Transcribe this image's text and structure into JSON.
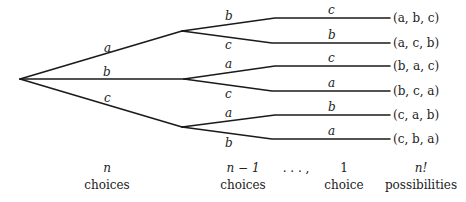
{
  "diagram": {
    "type": "permutation-tree",
    "root": {
      "x": 20,
      "y": 79
    },
    "level1": [
      {
        "label": "a",
        "node": {
          "x": 182,
          "y": 31
        },
        "label_pos": {
          "x": 107,
          "y": 49
        },
        "children": [
          {
            "label": "b",
            "label_pos": {
              "x": 229,
              "y": 18
            },
            "line_y": 18,
            "second": "c",
            "second_pos": {
              "x": 331,
              "y": 12
            },
            "leaf": "(a, b, c)"
          },
          {
            "label": "c",
            "label_pos": {
              "x": 229,
              "y": 48
            },
            "line_y": 43,
            "second": "b",
            "second_pos": {
              "x": 331,
              "y": 37
            },
            "leaf": "(a, c, b)"
          }
        ]
      },
      {
        "label": "b",
        "node": {
          "x": 184,
          "y": 79
        },
        "label_pos": {
          "x": 107,
          "y": 75
        },
        "children": [
          {
            "label": "a",
            "label_pos": {
              "x": 229,
              "y": 66
            },
            "line_y": 66,
            "second": "c",
            "second_pos": {
              "x": 331,
              "y": 60
            },
            "leaf": "(b, a, c)"
          },
          {
            "label": "c",
            "label_pos": {
              "x": 229,
              "y": 97
            },
            "line_y": 91,
            "second": "a",
            "second_pos": {
              "x": 331,
              "y": 85
            },
            "leaf": "(b, c, a)"
          }
        ]
      },
      {
        "label": "c",
        "node": {
          "x": 182,
          "y": 127
        },
        "label_pos": {
          "x": 107,
          "y": 101
        },
        "children": [
          {
            "label": "a",
            "label_pos": {
              "x": 229,
              "y": 115
            },
            "line_y": 115,
            "second": "b",
            "second_pos": {
              "x": 331,
              "y": 109
            },
            "leaf": "(c, a, b)"
          },
          {
            "label": "b",
            "label_pos": {
              "x": 229,
              "y": 146
            },
            "line_y": 139,
            "second": "a",
            "second_pos": {
              "x": 331,
              "y": 133
            },
            "leaf": "(c, b, a)"
          }
        ]
      }
    ],
    "captions": [
      {
        "top": "n",
        "bottom": "choices",
        "x": 107
      },
      {
        "top": "n − 1",
        "bottom": "choices",
        "x": 243
      },
      {
        "top": ". . . ,",
        "bottom": "",
        "x": 296
      },
      {
        "top": "1",
        "bottom": "choice",
        "x": 344
      },
      {
        "top": "n!",
        "bottom": "possibilities",
        "x": 421
      }
    ]
  }
}
